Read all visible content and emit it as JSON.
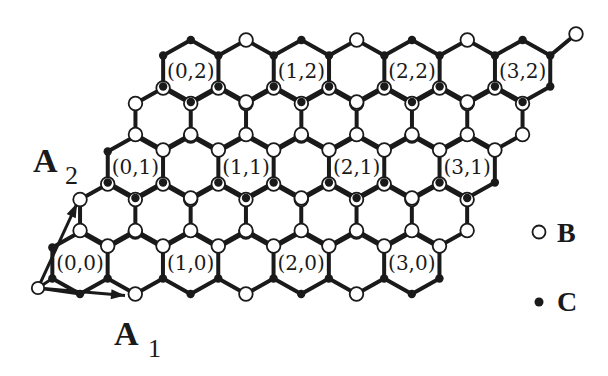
{
  "diagram": {
    "colors": {
      "ink": "#1a1a1a",
      "background": "#ffffff",
      "open_atom_fill": "#ffffff"
    },
    "lattice": {
      "type": "honeycomb",
      "orientation": "pointy-top",
      "rows": 5,
      "hexes_per_row": 7,
      "origin_center": [
        80,
        263
      ],
      "hex_step_x": 55.3,
      "row_step": [
        27.7,
        -48
      ],
      "side": 31,
      "supercell_step": 2
    },
    "cells": [
      {
        "label": "(0,0)",
        "i": 0,
        "j": 0
      },
      {
        "label": "(1,0)",
        "i": 1,
        "j": 0
      },
      {
        "label": "(2,0)",
        "i": 2,
        "j": 0
      },
      {
        "label": "(3,0)",
        "i": 3,
        "j": 0
      },
      {
        "label": "(0,1)",
        "i": 0,
        "j": 1
      },
      {
        "label": "(1,1)",
        "i": 1,
        "j": 1
      },
      {
        "label": "(2,1)",
        "i": 2,
        "j": 1
      },
      {
        "label": "(3,1)",
        "i": 3,
        "j": 1
      },
      {
        "label": "(0,2)",
        "i": 0,
        "j": 2
      },
      {
        "label": "(1,2)",
        "i": 1,
        "j": 2
      },
      {
        "label": "(2,2)",
        "i": 2,
        "j": 2
      },
      {
        "label": "(3,2)",
        "i": 3,
        "j": 2
      }
    ],
    "vectors": {
      "origin": [
        38,
        288
      ],
      "a1": {
        "letter": "A",
        "subscript": "1",
        "tip": [
          132,
          296
        ],
        "label_pos": [
          114,
          345
        ]
      },
      "a2": {
        "letter": "A",
        "subscript": "2",
        "tip": [
          80,
          197
        ],
        "label_pos": [
          33,
          172
        ]
      }
    },
    "dangling_bond": {
      "from_hex_row": 4,
      "from_hex_col": 6,
      "tip": [
        576,
        34
      ]
    },
    "legend": [
      {
        "symbol": "open-circle",
        "label": "B",
        "meaning": "B atom site (white)"
      },
      {
        "symbol": "filled-dot",
        "label": "C",
        "meaning": "C atom site (black)"
      }
    ]
  }
}
